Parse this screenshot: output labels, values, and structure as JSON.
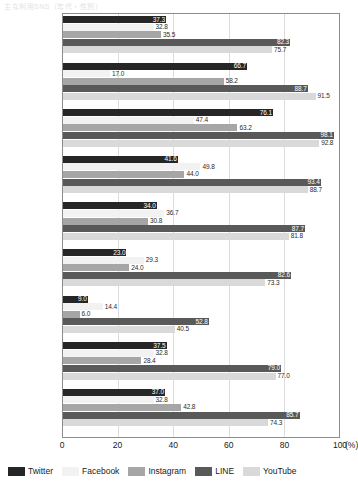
{
  "chart_data": {
    "type": "bar",
    "orientation": "horizontal",
    "title": "主な利用SNS（年代・性別）",
    "xlabel": "(%)",
    "ylabel": "",
    "xlim": [
      0,
      100
    ],
    "xticks": [
      0,
      20,
      40,
      60,
      80,
      100
    ],
    "unit": "(%)",
    "grid": true,
    "legend_position": "bottom",
    "categories": [
      "全年代",
      "10代",
      "20代",
      "30代",
      "40代",
      "50代",
      "60代",
      "男性",
      "女性"
    ],
    "category_counts": [
      "(N=1500)",
      "(N=141)",
      "(N=209)",
      "(N=257)",
      "(N=324)",
      "(N=270)",
      "(N=299)",
      "(N=757)",
      "(N=743)"
    ],
    "series": [
      {
        "name": "Twitter",
        "color": "#262626",
        "values": [
          37.3,
          66.7,
          76.1,
          41.6,
          34.0,
          23.0,
          9.0,
          37.5,
          37.0
        ]
      },
      {
        "name": "Facebook",
        "color": "#f2f2f2",
        "values": [
          32.8,
          17.0,
          47.4,
          49.8,
          36.7,
          29.3,
          14.4,
          32.8,
          32.8
        ]
      },
      {
        "name": "Instagram",
        "color": "#a6a6a6",
        "values": [
          35.5,
          58.2,
          63.2,
          44.0,
          30.8,
          24.0,
          6.0,
          28.4,
          42.8
        ]
      },
      {
        "name": "LINE",
        "color": "#595959",
        "values": [
          82.3,
          88.7,
          98.1,
          93.4,
          87.7,
          82.6,
          52.8,
          79.0,
          85.7
        ]
      },
      {
        "name": "YouTube",
        "color": "#d9d9d9",
        "values": [
          75.7,
          91.5,
          92.8,
          88.7,
          81.8,
          73.3,
          40.5,
          77.0,
          74.3
        ]
      }
    ]
  }
}
